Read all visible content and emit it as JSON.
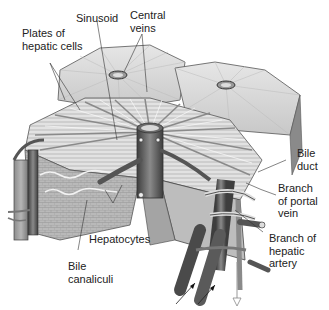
{
  "figure": {
    "labels": {
      "sinusoid": "Sinusoid",
      "central_veins": [
        "Central",
        "veins"
      ],
      "plates": [
        "Plates of",
        "hepatic cells"
      ],
      "bile_duct": [
        "Bile",
        "duct"
      ],
      "portal_vein": [
        "Branch",
        "of portal",
        "vein"
      ],
      "hepatic_artery": [
        "Branch of",
        "hepatic",
        "artery"
      ],
      "hepatocytes": "Hepatocytes",
      "bile_canaliculi": [
        "Bile",
        "canaliculi"
      ]
    },
    "colors": {
      "background": "#ffffff",
      "tissue_light": "#dcdcdc",
      "tissue_mid": "#a8a8a8",
      "tissue_dark": "#5a5a5a",
      "vessel_dark": "#4a4a4a",
      "leader_line": "#333333"
    }
  }
}
